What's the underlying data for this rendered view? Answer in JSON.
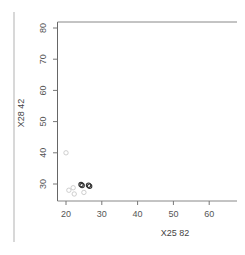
{
  "chart_data": {
    "type": "scatter",
    "title": "",
    "xlabel": "X25 82",
    "ylabel": "X28 42",
    "xlim": [
      18,
      67
    ],
    "ylim": [
      25,
      82
    ],
    "x_ticks": [
      20,
      30,
      40,
      50,
      60
    ],
    "y_ticks": [
      30,
      40,
      50,
      60,
      70,
      80
    ],
    "grid": false,
    "legend": null,
    "series": [
      {
        "name": "light",
        "color": "#c8c8c8",
        "points": [
          {
            "x": 20.0,
            "y": 40.0
          },
          {
            "x": 20.8,
            "y": 28.0
          },
          {
            "x": 22.0,
            "y": 28.8
          },
          {
            "x": 22.3,
            "y": 26.8
          },
          {
            "x": 25.0,
            "y": 27.3
          }
        ]
      },
      {
        "name": "dark",
        "color": "#333333",
        "points": [
          {
            "x": 24.2,
            "y": 29.8
          },
          {
            "x": 24.5,
            "y": 29.5
          },
          {
            "x": 26.3,
            "y": 29.6
          },
          {
            "x": 26.6,
            "y": 29.3
          }
        ]
      }
    ]
  }
}
